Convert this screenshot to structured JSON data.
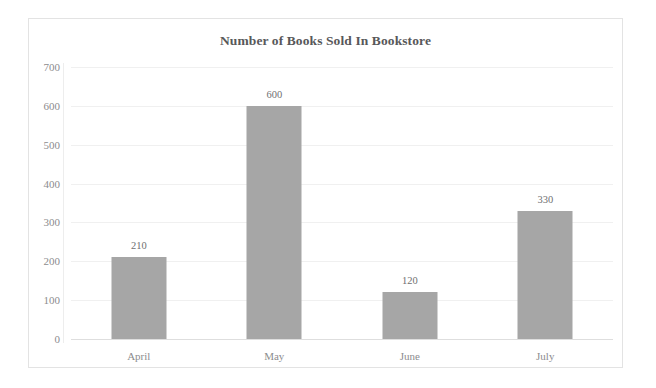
{
  "chart_data": {
    "type": "bar",
    "title": "Number of Books Sold In Bookstore",
    "xlabel": "",
    "ylabel": "",
    "categories": [
      "April",
      "May",
      "June",
      "July"
    ],
    "values": [
      210,
      600,
      120,
      330
    ],
    "value_labels": [
      "210",
      "600",
      "120",
      "330"
    ],
    "ylim": [
      0,
      700
    ],
    "ytick_step": 100,
    "ytick_labels": [
      "0",
      "100",
      "200",
      "300",
      "400",
      "500",
      "600",
      "700"
    ],
    "grid": "horizontal",
    "legend": "none",
    "bar_color": "#a6a6a6",
    "grid_color": "#f0f0f0",
    "axis_color": "#dedede",
    "text_color": "#8c8c8e",
    "title_color": "#58585a",
    "border_color": "#e3e3e3",
    "background": "#ffffff"
  }
}
